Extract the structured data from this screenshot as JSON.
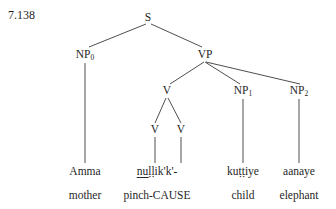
{
  "example_number": "7.138",
  "colors": {
    "text": "#1f1f1f",
    "line": "#3a3a3a",
    "background": "#ffffff"
  },
  "tree": {
    "type": "syntax-tree",
    "nodes": [
      {
        "id": "S",
        "label": "S",
        "subscript": "",
        "x": 148,
        "y": 18
      },
      {
        "id": "NP0",
        "label": "NP",
        "subscript": "0",
        "x": 85,
        "y": 56
      },
      {
        "id": "VP",
        "label": "VP",
        "subscript": "",
        "x": 205,
        "y": 56
      },
      {
        "id": "V",
        "label": "V",
        "subscript": "",
        "x": 167,
        "y": 92
      },
      {
        "id": "NP1",
        "label": "NP",
        "subscript": "1",
        "x": 243,
        "y": 92
      },
      {
        "id": "NP2",
        "label": "NP",
        "subscript": "2",
        "x": 299,
        "y": 92
      },
      {
        "id": "V1",
        "label": "V",
        "subscript": "",
        "x": 155,
        "y": 131
      },
      {
        "id": "V2",
        "label": "V",
        "subscript": "",
        "x": 181,
        "y": 131
      }
    ],
    "edges": [
      {
        "from": "S",
        "to": "NP0"
      },
      {
        "from": "S",
        "to": "VP"
      },
      {
        "from": "NP0",
        "to": "Amma"
      },
      {
        "from": "VP",
        "to": "V"
      },
      {
        "from": "VP",
        "to": "NP1"
      },
      {
        "from": "VP",
        "to": "NP2"
      },
      {
        "from": "V",
        "to": "V1"
      },
      {
        "from": "V",
        "to": "V2"
      },
      {
        "from": "V1",
        "to": "term1"
      },
      {
        "from": "V2",
        "to": "term2"
      },
      {
        "from": "NP1",
        "to": "term3"
      },
      {
        "from": "NP2",
        "to": "term4"
      }
    ]
  },
  "terminals": [
    {
      "id": "term0",
      "text": "Amma",
      "x": 85,
      "y": 172,
      "underlined": false
    },
    {
      "id": "term1",
      "text": "nuḷḷik'k'-",
      "x": 157,
      "y": 172,
      "underlined": true,
      "underline_prefix": "nu",
      "underline_suffix": "ḷḷik'k'-"
    },
    {
      "id": "term3",
      "text": "kuṭṭiye",
      "x": 243,
      "y": 172,
      "underlined": false
    },
    {
      "id": "term4",
      "text": "aanaye",
      "x": 299,
      "y": 172,
      "underlined": false
    }
  ],
  "glosses": [
    {
      "id": "gloss0",
      "text": "mother",
      "x": 85,
      "y": 196
    },
    {
      "id": "gloss1",
      "text": "pinch-CAUSE",
      "x": 157,
      "y": 196
    },
    {
      "id": "gloss3",
      "text": "child",
      "x": 243,
      "y": 196
    },
    {
      "id": "gloss4",
      "text": "elephant",
      "x": 299,
      "y": 196
    }
  ]
}
